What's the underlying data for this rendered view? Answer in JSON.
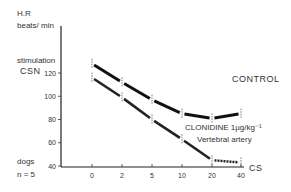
{
  "labels": {
    "y_title_line1": "H.R",
    "y_title_line2": "beats/ min",
    "y_sub_line1": "stimulation",
    "y_sub_line2": "CSN",
    "dogs": "dogs",
    "n": "n = 5",
    "x_unit": "CS",
    "control": "CONTROL",
    "clonidine_line1": "CLONIDINE 1µg/kg⁻¹",
    "clonidine_line2": "Vertebral artery"
  },
  "chart_data": {
    "type": "line",
    "title": "",
    "xlabel": "CS",
    "ylabel": "H.R beats/min stimulation CSN",
    "categories": [
      "0",
      "2",
      "5",
      "10",
      "20",
      "40"
    ],
    "y_ticks": [
      40,
      60,
      80,
      100,
      120
    ],
    "ylim": [
      40,
      130
    ],
    "grid": false,
    "series": [
      {
        "name": "CONTROL",
        "values": [
          128,
          112,
          97,
          85,
          81,
          85
        ]
      },
      {
        "name": "CLONIDINE 1µg/kg⁻¹ Vertebral artery",
        "values": [
          116,
          99,
          80,
          63,
          45,
          43
        ]
      }
    ],
    "annotations": [
      "dogs",
      "n = 5"
    ]
  }
}
